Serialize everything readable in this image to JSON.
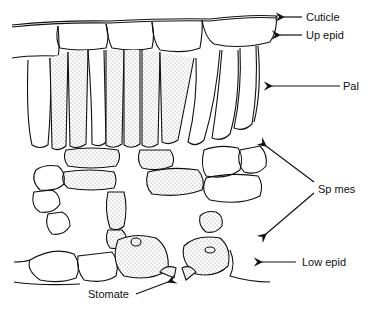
{
  "diagram": {
    "labels": [
      {
        "id": "cuticle",
        "text": "Cuticle"
      },
      {
        "id": "up-epid",
        "text": "Up epid"
      },
      {
        "id": "pal",
        "text": "Pal"
      },
      {
        "id": "sp-mes",
        "text": "Sp mes"
      },
      {
        "id": "low-epid",
        "text": "Low epid"
      },
      {
        "id": "stomate",
        "text": "Stomate"
      }
    ]
  }
}
